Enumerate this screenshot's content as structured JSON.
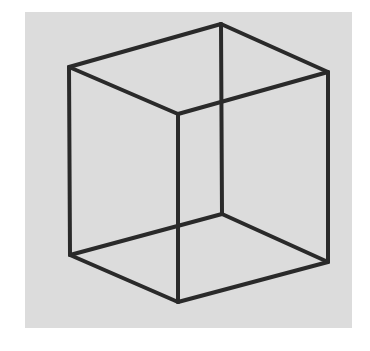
{
  "figure": {
    "colors": {
      "background": "#ffffff",
      "panel": "#dcdcdc",
      "stroke": "#2a2a2a"
    },
    "panel": {
      "x": 25,
      "y": 12,
      "width": 327,
      "height": 316
    },
    "vertices": {
      "top_left": [
        69,
        67
      ],
      "top_back": [
        221,
        24
      ],
      "top_right": [
        328,
        72
      ],
      "top_front": [
        178,
        114
      ],
      "bottom_left": [
        70,
        255
      ],
      "bottom_back": [
        222,
        214
      ],
      "bottom_right": [
        328,
        262
      ],
      "bottom_front": [
        178,
        302
      ]
    },
    "edges": [
      [
        "top_left",
        "top_back"
      ],
      [
        "top_back",
        "top_right"
      ],
      [
        "top_right",
        "top_front"
      ],
      [
        "top_front",
        "top_left"
      ],
      [
        "bottom_left",
        "bottom_back"
      ],
      [
        "bottom_back",
        "bottom_right"
      ],
      [
        "bottom_right",
        "bottom_front"
      ],
      [
        "bottom_front",
        "bottom_left"
      ],
      [
        "top_left",
        "bottom_left"
      ],
      [
        "top_back",
        "bottom_back"
      ],
      [
        "top_right",
        "bottom_right"
      ],
      [
        "top_front",
        "bottom_front"
      ]
    ]
  }
}
